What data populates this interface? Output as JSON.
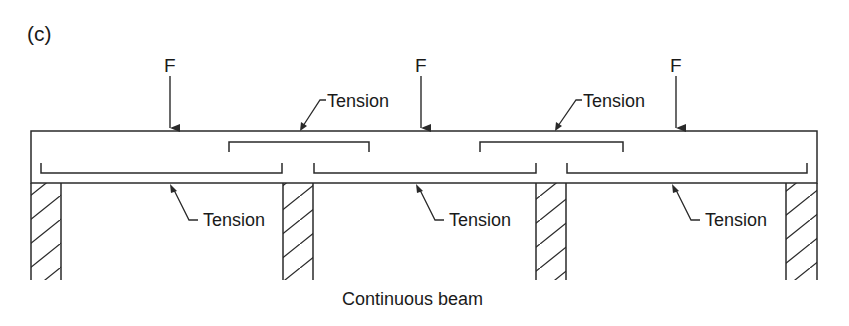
{
  "figure": {
    "panel_label": "(c)",
    "caption": "Continuous beam"
  },
  "forces": [
    {
      "label": "F",
      "x": 170
    },
    {
      "label": "F",
      "x": 421
    },
    {
      "label": "F",
      "x": 676
    }
  ],
  "tension_labels": {
    "top": [
      {
        "label": "Tension",
        "x": 327,
        "y": 92
      },
      {
        "label": "Tension",
        "x": 583,
        "y": 92
      }
    ],
    "bottom": [
      {
        "label": "Tension",
        "x": 203,
        "y": 210
      },
      {
        "label": "Tension",
        "x": 449,
        "y": 210
      },
      {
        "label": "Tension",
        "x": 705,
        "y": 210
      }
    ]
  },
  "beam": {
    "x1": 31,
    "x2": 817,
    "top": 131,
    "bottom": 183
  },
  "supports": [
    {
      "x1": 31,
      "x2": 61
    },
    {
      "x1": 283,
      "x2": 313
    },
    {
      "x1": 536,
      "x2": 566
    },
    {
      "x1": 786,
      "x2": 817
    }
  ],
  "colors": {
    "line": "#2a2a2a",
    "background": "#ffffff"
  }
}
